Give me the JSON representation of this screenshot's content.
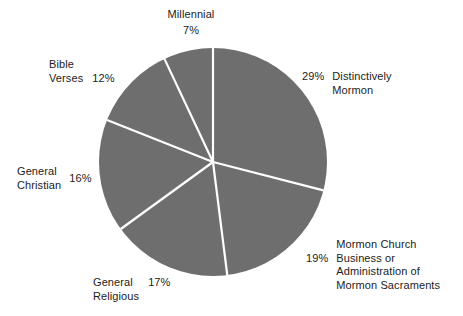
{
  "chart_data": {
    "type": "pie",
    "title": "",
    "subtitle": "",
    "xlabel": "",
    "ylabel": "",
    "legend_position": "none",
    "grid": false,
    "start_angle_deg": 0,
    "direction": "clockwise",
    "categories": [
      "Distinctively Mormon",
      "Mormon Church Business or Administration of Mormon Sacraments",
      "General Religious",
      "General Christian",
      "Bible Verses",
      "Millennial"
    ],
    "values": [
      29,
      19,
      17,
      16,
      12,
      7
    ],
    "value_unit": "%",
    "slice_color": "#6e6e6e",
    "divider_color": "#ffffff",
    "background_color": "#ffffff",
    "text_color": "#1c1c1c",
    "slices": [
      {
        "label": "Distinctively\nMormon",
        "label_flat": "Distinctively Mormon",
        "percent": "29%",
        "value": 29
      },
      {
        "label": "Mormon Church\nBusiness or\nAdministration of\nMormon Sacraments",
        "label_flat": "Mormon Church Business or Administration of Mormon Sacraments",
        "percent": "19%",
        "value": 19
      },
      {
        "label": "General\nReligious",
        "label_flat": "General Religious",
        "percent": "17%",
        "value": 17
      },
      {
        "label": "General\nChristian",
        "label_flat": "General Christian",
        "percent": "16%",
        "value": 16
      },
      {
        "label": "Bible\nVerses",
        "label_flat": "Bible Verses",
        "percent": "12%",
        "value": 12
      },
      {
        "label": "Millennial",
        "label_flat": "Millennial",
        "percent": "7%",
        "value": 7
      }
    ]
  },
  "geometry": {
    "center_x": 213,
    "center_y": 162,
    "radius": 114
  }
}
